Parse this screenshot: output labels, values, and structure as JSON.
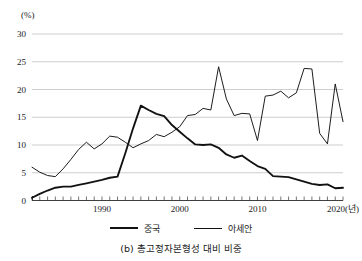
{
  "caption": "(b) 총고정자본형성 대비 비중",
  "axis": {
    "y_unit_label": "(%)",
    "x_unit_suffix": "(년)"
  },
  "legend": [
    {
      "label": "중국",
      "style": "thick"
    },
    {
      "label": "아세안",
      "style": "thin"
    }
  ],
  "chart_data": {
    "type": "line",
    "title": "(b) 총고정자본형성 대비 비중",
    "xlabel": "(년)",
    "ylabel": "(%)",
    "xlim": [
      1981,
      2021
    ],
    "ylim": [
      0,
      30
    ],
    "yticks": [
      0,
      5,
      10,
      15,
      20,
      25,
      30
    ],
    "xticks_labeled": [
      1990,
      2000,
      2010,
      2020
    ],
    "xtick_interval": 1,
    "grid": "horizontal",
    "legend_position": "bottom-center",
    "x": [
      1981,
      1982,
      1983,
      1984,
      1985,
      1986,
      1987,
      1988,
      1989,
      1990,
      1991,
      1992,
      1993,
      1994,
      1995,
      1996,
      1997,
      1998,
      1999,
      2000,
      2001,
      2002,
      2003,
      2004,
      2005,
      2006,
      2007,
      2008,
      2009,
      2010,
      2011,
      2012,
      2013,
      2014,
      2015,
      2016,
      2017,
      2018,
      2019,
      2020,
      2021
    ],
    "series": [
      {
        "name": "중국",
        "line_width": "thick",
        "color": "#111111",
        "values": [
          0.5,
          1.2,
          1.8,
          2.3,
          2.5,
          2.5,
          2.8,
          3.1,
          3.4,
          3.7,
          4.1,
          4.3,
          8.5,
          13.0,
          17.1,
          16.3,
          15.6,
          15.2,
          13.6,
          12.4,
          11.2,
          10.1,
          10.0,
          10.1,
          9.5,
          8.3,
          7.7,
          8.1,
          7.1,
          6.2,
          5.7,
          4.4,
          4.3,
          4.2,
          3.8,
          3.4,
          3.0,
          2.8,
          2.9,
          2.2,
          2.3
        ]
      },
      {
        "name": "아세안",
        "line_width": "thin",
        "color": "#111111",
        "values": [
          6.0,
          5.1,
          4.5,
          4.3,
          5.7,
          7.4,
          9.2,
          10.5,
          9.3,
          10.2,
          11.6,
          11.4,
          10.5,
          9.5,
          10.2,
          10.8,
          11.9,
          11.5,
          12.3,
          13.3,
          15.3,
          15.5,
          16.6,
          16.3,
          24.1,
          18.3,
          15.3,
          15.7,
          15.6,
          10.8,
          18.8,
          19.0,
          19.7,
          18.5,
          19.4,
          23.8,
          23.7,
          12.1,
          10.2,
          21.0,
          14.2
        ]
      }
    ],
    "asean_extra_points": {
      "note": "series continues to 2021 right edge",
      "x": [
        2012,
        2013,
        2014,
        2015,
        2016,
        2017,
        2018,
        2019,
        2020,
        2021
      ],
      "values": [
        16.5,
        17.0,
        17.0,
        18.2,
        18.4,
        15.5,
        18.0,
        20.0,
        17.9,
        20.1
      ]
    }
  }
}
